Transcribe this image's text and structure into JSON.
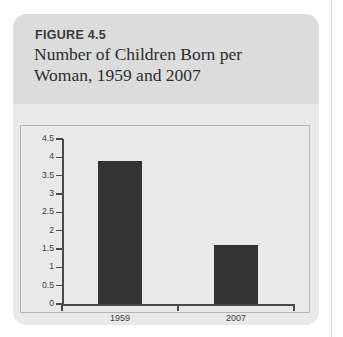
{
  "figure": {
    "number_label": "FIGURE 4.5",
    "title": "Number of Children Born per Woman, 1959 and 2007"
  },
  "colors": {
    "card_background": "#e9e9e9",
    "header_background": "#dcdcdc",
    "bar": "#333333",
    "axis": "#4a4a4a",
    "frame_border": "#b4b4b4",
    "page_background": "#ffffff",
    "column_rule": "#d9d9d9"
  },
  "chart_data": {
    "type": "bar",
    "title": "Number of Children Born per Woman, 1959 and 2007",
    "xlabel": "",
    "ylabel": "",
    "categories": [
      "1959",
      "2007"
    ],
    "values": [
      3.9,
      1.6
    ],
    "ylim": [
      0,
      4.5
    ],
    "ytick_labels": [
      "0",
      "0.5",
      "1",
      "1.5",
      "2",
      "2.5",
      "3",
      "3.5",
      "4",
      "4.5"
    ],
    "ytick_values": [
      0,
      0.5,
      1,
      1.5,
      2,
      2.5,
      3,
      3.5,
      4,
      4.5
    ],
    "grid": false,
    "legend": null,
    "bar_color": "#333333"
  }
}
